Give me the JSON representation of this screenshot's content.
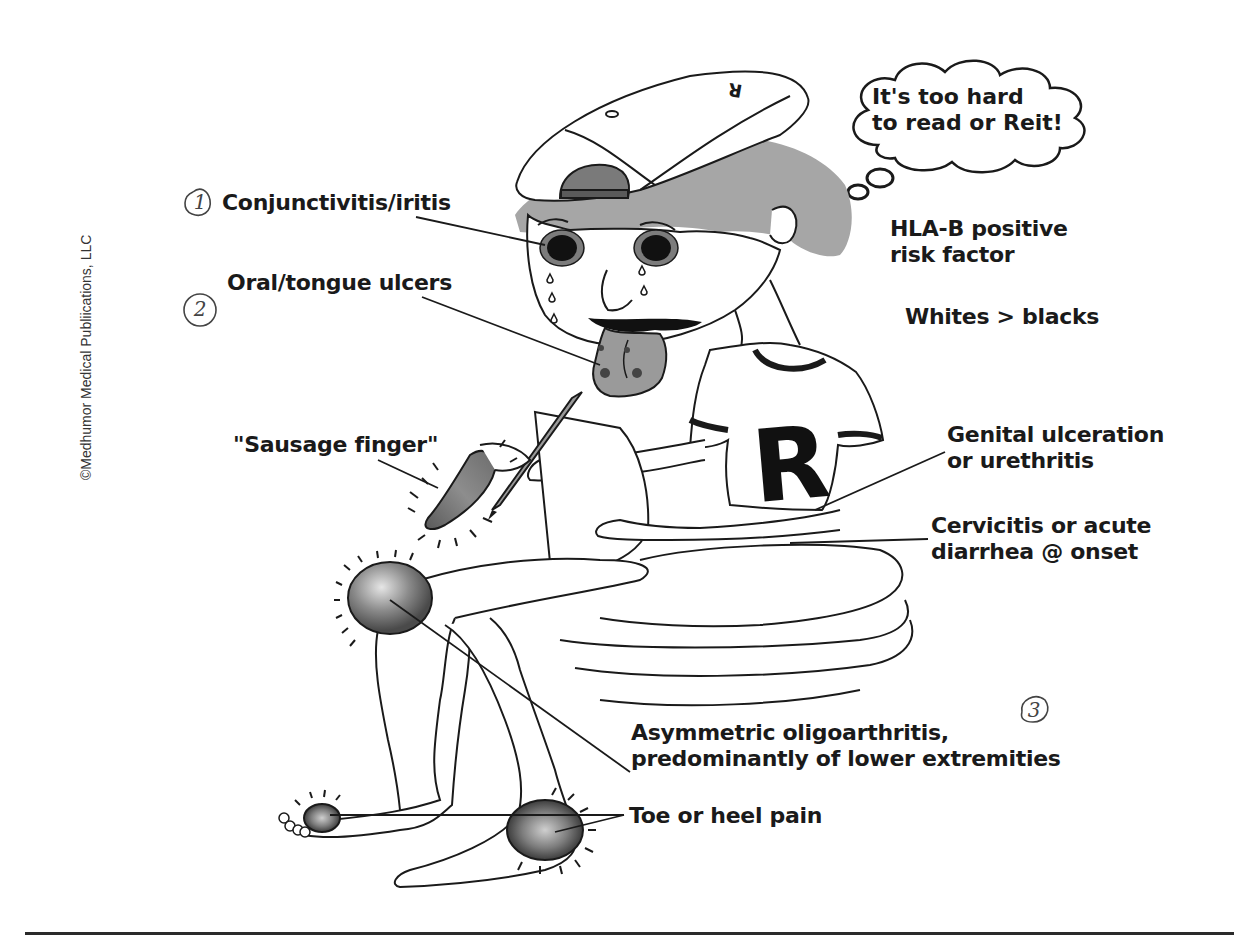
{
  "figure": {
    "copyright": "©Medhumor Medical Publiications, LLC",
    "thought_bubble": {
      "line1": "It's too hard",
      "line2": "to read or Reit!"
    },
    "side_notes": {
      "hla_line1": "HLA-B positive",
      "hla_line2": "risk factor",
      "demographic": "Whites > blacks"
    },
    "labels": {
      "conjunctivitis": "Conjunctivitis/iritis",
      "oral_ulcers": "Oral/tongue ulcers",
      "sausage_finger": "\"Sausage finger\"",
      "genital_line1": "Genital ulceration",
      "genital_line2": "or urethritis",
      "cervicitis_line1": "Cervicitis or acute",
      "cervicitis_line2": "diarrhea @ onset",
      "arthritis_line1": "Asymmetric oligoarthritis,",
      "arthritis_line2": "predominantly of lower extremities",
      "toe_heel": "Toe or heel pain"
    },
    "handwritten_marks": {
      "mark1": "1",
      "mark2": "2",
      "mark3": "3"
    },
    "cap_letter": "R",
    "shirt_letter": "R",
    "colors": {
      "ink": "#1a1a1a",
      "shade": "#9a9a9a",
      "hair": "#a6a6a6",
      "inflamed": "#555555"
    }
  }
}
